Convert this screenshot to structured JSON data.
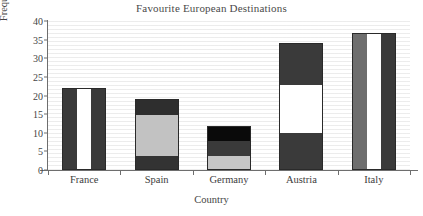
{
  "chart_data": {
    "type": "bar",
    "title": "Favourite European Destinations",
    "xlabel": "Country",
    "ylabel": "Frequency",
    "categories": [
      "France",
      "Spain",
      "Germany",
      "Austria",
      "Italy"
    ],
    "values": [
      22,
      19,
      11.7,
      34,
      36.7
    ],
    "ylim": [
      0,
      40
    ],
    "yticks": [
      0,
      5,
      10,
      15,
      20,
      25,
      30,
      35,
      40
    ],
    "grid": true,
    "legend": "none",
    "bars": [
      {
        "category": "France",
        "total": 22,
        "fill_style": "vertical-stripes",
        "vertical_stripes": [
          "#3a3a3a",
          "#ffffff",
          "#3a3a3a"
        ],
        "segments": [
          {
            "from": 0,
            "to": 22,
            "color": "#3a3a3a"
          }
        ]
      },
      {
        "category": "Spain",
        "total": 19,
        "fill_style": "horizontal-segments",
        "segments": [
          {
            "from": 0,
            "to": 4,
            "color": "#333333"
          },
          {
            "from": 4,
            "to": 15,
            "color": "#c2c2c2"
          },
          {
            "from": 15,
            "to": 19,
            "color": "#2e2e2e"
          }
        ]
      },
      {
        "category": "Germany",
        "total": 11.7,
        "fill_style": "horizontal-segments",
        "segments": [
          {
            "from": 0,
            "to": 4,
            "color": "#c6c6c6"
          },
          {
            "from": 4,
            "to": 8,
            "color": "#3a3a3a"
          },
          {
            "from": 8,
            "to": 11.7,
            "color": "#0a0a0a"
          }
        ]
      },
      {
        "category": "Austria",
        "total": 34,
        "fill_style": "horizontal-segments",
        "segments": [
          {
            "from": 0,
            "to": 10.2,
            "color": "#3a3a3a"
          },
          {
            "from": 10.2,
            "to": 23.2,
            "color": "#ffffff"
          },
          {
            "from": 23.2,
            "to": 34,
            "color": "#3a3a3a"
          }
        ]
      },
      {
        "category": "Italy",
        "total": 36.7,
        "fill_style": "vertical-stripes",
        "vertical_stripes": [
          "#6e6e6e",
          "#ffffff",
          "#3a3a3a"
        ],
        "segments": [
          {
            "from": 0,
            "to": 36.7,
            "color": "#3a3a3a"
          }
        ]
      }
    ]
  },
  "yticklabels": [
    "40",
    "35",
    "30",
    "25",
    "20",
    "15",
    "10",
    "5",
    "0"
  ]
}
